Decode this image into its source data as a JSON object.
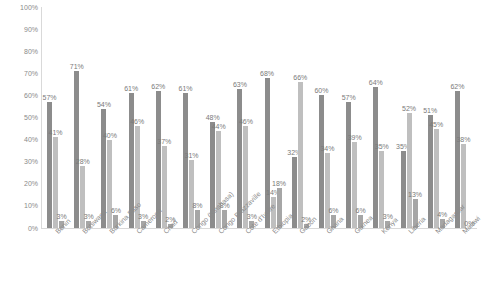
{
  "chart_data": {
    "type": "bar",
    "title": "",
    "xlabel": "",
    "ylabel": "",
    "ylim": [
      0,
      100
    ],
    "grid": false,
    "legend": "none",
    "ytick_labels": [
      "100%",
      "90%",
      "80%",
      "70%",
      "60%",
      "50%",
      "40%",
      "30%",
      "20%",
      "10%",
      "0%"
    ],
    "ytick_values": [
      100,
      90,
      80,
      70,
      60,
      50,
      40,
      30,
      20,
      10,
      0
    ],
    "categories": [
      "Benin",
      "Botswana",
      "Burkina Faso",
      "Cameroon",
      "Chad",
      "Congo (Kinshasa)",
      "Congo Brazzaville",
      "Cote d'Ivoire",
      "Ethiopia",
      "Gabon",
      "Ghana",
      "Guinea",
      "Kenya",
      "Liberia",
      "Madagascar",
      "Malawi"
    ],
    "series": [
      {
        "name": "Series 1",
        "color": "#8c8c8c",
        "values": [
          57,
          71,
          54,
          61,
          62,
          61,
          48,
          63,
          68,
          32,
          60,
          57,
          64,
          35,
          51,
          62
        ]
      },
      {
        "name": "Series 2",
        "color": "#bfbfbf",
        "values": [
          41,
          28,
          40,
          46,
          37,
          31,
          44,
          46,
          14,
          66,
          34,
          39,
          35,
          52,
          45,
          38
        ]
      },
      {
        "name": "Series 3",
        "color": "#a6a6a6",
        "values": [
          3,
          3,
          6,
          3,
          2,
          8,
          8,
          3,
          18,
          2,
          6,
          6,
          3,
          13,
          4,
          0
        ]
      }
    ],
    "data_labels": [
      [
        "57%",
        "41%",
        "3%"
      ],
      [
        "71%",
        "28%",
        "3%"
      ],
      [
        "54%",
        "40%",
        "6%"
      ],
      [
        "61%",
        "46%",
        "3%"
      ],
      [
        "62%",
        "37%",
        "2%"
      ],
      [
        "61%",
        "31%",
        "8%"
      ],
      [
        "48%",
        "44%",
        "8%"
      ],
      [
        "63%",
        "46%",
        "3%"
      ],
      [
        "68%",
        "14%",
        "18%"
      ],
      [
        "32%",
        "66%",
        "2%"
      ],
      [
        "60%",
        "34%",
        "6%"
      ],
      [
        "57%",
        "39%",
        "6%"
      ],
      [
        "64%",
        "35%",
        "3%"
      ],
      [
        "35%",
        "52%",
        "13%"
      ],
      [
        "51%",
        "45%",
        "4%"
      ],
      [
        "62%",
        "38%",
        "0%"
      ]
    ]
  }
}
